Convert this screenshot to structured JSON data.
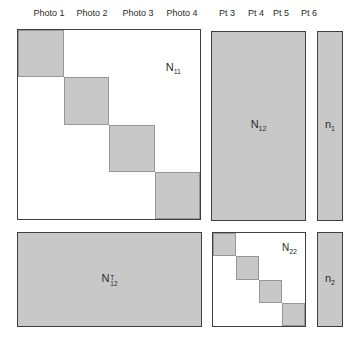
{
  "figure": {
    "colors": {
      "background": "#ffffff",
      "block_fill": "#c8c8c8",
      "matrix_border": "#3f3f3f",
      "block_border": "#979797",
      "text": "#2a2a2a"
    },
    "header": {
      "photo_labels": [
        "Photo 1",
        "Photo 2",
        "Photo 3",
        "Photo 4"
      ],
      "pt_labels": [
        "Pt 3",
        "Pt 4",
        "Pt 5",
        "Pt 6"
      ]
    },
    "matrices": {
      "n11": {
        "base": "N",
        "sub": "11"
      },
      "n12": {
        "base": "N",
        "sub": "12"
      },
      "n1": {
        "base": "n",
        "sub": "1"
      },
      "n12t": {
        "base": "N",
        "sub": "12",
        "sup": "T"
      },
      "n22": {
        "base": "N",
        "sub": "22"
      },
      "n2": {
        "base": "n",
        "sub": "2"
      }
    }
  }
}
